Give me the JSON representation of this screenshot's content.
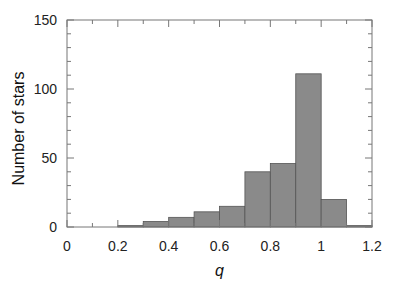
{
  "chart_data": {
    "type": "bar",
    "title": "",
    "xlabel": "q",
    "ylabel": "Number of stars",
    "xlim": [
      0,
      1.2
    ],
    "ylim": [
      0,
      150
    ],
    "xticks": [
      "0",
      "0.2",
      "0.4",
      "0.6",
      "0.8",
      "1",
      "1.2"
    ],
    "yticks": [
      "0",
      "50",
      "100",
      "150"
    ],
    "bin_edges": [
      0.2,
      0.3,
      0.4,
      0.5,
      0.6,
      0.7,
      0.8,
      0.9,
      1.0,
      1.1,
      1.2
    ],
    "categories": [
      "0.2-0.3",
      "0.3-0.4",
      "0.4-0.5",
      "0.5-0.6",
      "0.6-0.7",
      "0.7-0.8",
      "0.8-0.9",
      "0.9-1.0",
      "1.0-1.1",
      "1.1-1.2"
    ],
    "values": [
      1,
      4,
      7,
      11,
      15,
      40,
      46,
      111,
      20,
      1
    ],
    "grid": false,
    "legend": null,
    "bar_color": "#8a8a8a"
  }
}
